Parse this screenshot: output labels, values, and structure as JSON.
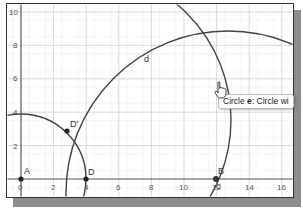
{
  "app": "Geometry graphics view",
  "axes": {
    "x_ticks": [
      "0",
      "2",
      "4",
      "6",
      "8",
      "10",
      "12",
      "14",
      "16"
    ],
    "y_ticks": [
      "0",
      "2",
      "4",
      "6",
      "8",
      "10"
    ],
    "grid": true
  },
  "points": [
    {
      "name": "A",
      "label": "A",
      "x": 0,
      "y": 0
    },
    {
      "name": "D",
      "label": "D",
      "x": 4,
      "y": 0
    },
    {
      "name": "D'",
      "label": "D'",
      "x": 2.8,
      "y": 2.9
    },
    {
      "name": "B",
      "label": "B",
      "x": 12,
      "y": 0
    },
    {
      "name": "C",
      "label": "C",
      "x": 12,
      "y": 0
    }
  ],
  "objects": [
    {
      "name": "circle-center-A",
      "label": ""
    },
    {
      "name": "circle-d",
      "label": "d"
    },
    {
      "name": "circle-e",
      "label": "e"
    }
  ],
  "tooltip": {
    "prefix": "Circle ",
    "object": "e",
    "suffix": ": Circle wi"
  },
  "colors": {
    "curve": "#444444",
    "point": "#222222",
    "grid_major": "#cfcfcf",
    "grid_minor": "#ececec",
    "axis": "#555555"
  }
}
